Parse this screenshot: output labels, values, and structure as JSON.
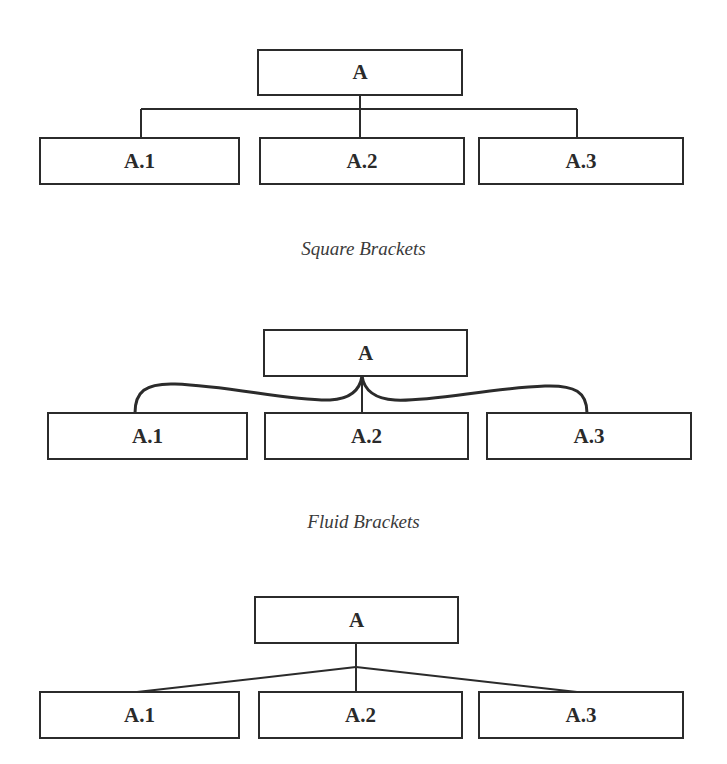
{
  "diagrams": [
    {
      "style": "square",
      "caption": "Square Brackets",
      "parent": {
        "label": "A"
      },
      "children": [
        {
          "label": "A.1"
        },
        {
          "label": "A.2"
        },
        {
          "label": "A.3"
        }
      ]
    },
    {
      "style": "fluid",
      "caption": "Fluid Brackets",
      "parent": {
        "label": "A"
      },
      "children": [
        {
          "label": "A.1"
        },
        {
          "label": "A.2"
        },
        {
          "label": "A.3"
        }
      ]
    },
    {
      "style": "straight",
      "caption": "",
      "parent": {
        "label": "A"
      },
      "children": [
        {
          "label": "A.1"
        },
        {
          "label": "A.2"
        },
        {
          "label": "A.3"
        }
      ]
    }
  ],
  "colors": {
    "line": "#2b2b2b",
    "text": "#2a2a2a",
    "caption": "#3a3a3a",
    "background": "#ffffff"
  }
}
